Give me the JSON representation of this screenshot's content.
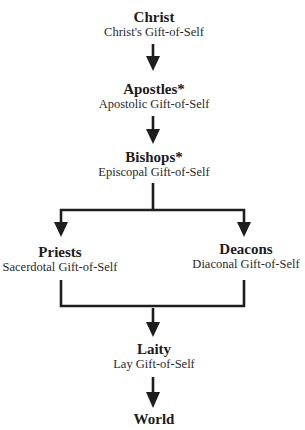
{
  "diagram": {
    "type": "flowchart",
    "colors": {
      "line": "#1e1e1e",
      "text": "#1c1c1c",
      "background": "#ffffff"
    },
    "nodes": {
      "christ": {
        "title": "Christ",
        "subtitle": "Christ's Gift-of-Self"
      },
      "apostles": {
        "title": "Apostles*",
        "subtitle": "Apostolic Gift-of-Self"
      },
      "bishops": {
        "title": "Bishops*",
        "subtitle": "Episcopal Gift-of-Self"
      },
      "priests": {
        "title": "Priests",
        "subtitle": "Sacerdotal Gift-of-Self"
      },
      "deacons": {
        "title": "Deacons",
        "subtitle": "Diaconal Gift-of-Self"
      },
      "laity": {
        "title": "Laity",
        "subtitle": "Lay Gift-of-Self"
      },
      "world": {
        "title": "World"
      }
    },
    "edges": [
      {
        "from": "Christ",
        "to": "Apostles"
      },
      {
        "from": "Apostles",
        "to": "Bishops"
      },
      {
        "from": "Bishops",
        "to": "Priests"
      },
      {
        "from": "Bishops",
        "to": "Deacons"
      },
      {
        "from": "Priests",
        "to": "Laity"
      },
      {
        "from": "Deacons",
        "to": "Laity"
      },
      {
        "from": "Laity",
        "to": "World"
      }
    ]
  }
}
